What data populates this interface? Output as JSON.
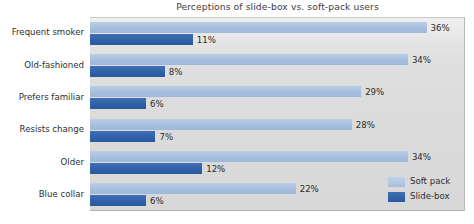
{
  "chart_data": {
    "type": "bar",
    "orientation": "horizontal",
    "title": "Perceptions of slide-box vs. soft-pack users",
    "xlabel": "",
    "ylabel": "",
    "xlim": [
      0,
      40
    ],
    "grid": false,
    "legend_position": "bottom-right",
    "value_suffix": "%",
    "categories": [
      "Frequent smoker",
      "Old-fashioned",
      "Prefers familiar",
      "Resists change",
      "Older",
      "Blue collar"
    ],
    "series": [
      {
        "name": "Soft pack",
        "color": "#a6bfdd",
        "values": [
          36,
          34,
          29,
          28,
          34,
          22
        ],
        "labels": [
          "36%",
          "34%",
          "29%",
          "28%",
          "34%",
          "22%"
        ]
      },
      {
        "name": "Slide-box",
        "color": "#2f5fa6",
        "values": [
          11,
          8,
          6,
          7,
          12,
          6
        ],
        "labels": [
          "11%",
          "8%",
          "6%",
          "7%",
          "12%",
          "6%"
        ]
      }
    ]
  },
  "legend": {
    "items": [
      {
        "label": "Soft pack"
      },
      {
        "label": "Slide-box"
      }
    ]
  },
  "colors": {
    "soft_pack": "#a6bfdd",
    "slide_box": "#2f5fa6",
    "plot_background": "#dcdcdc",
    "page_background": "#ffffff",
    "text": "#2e2e2e"
  }
}
